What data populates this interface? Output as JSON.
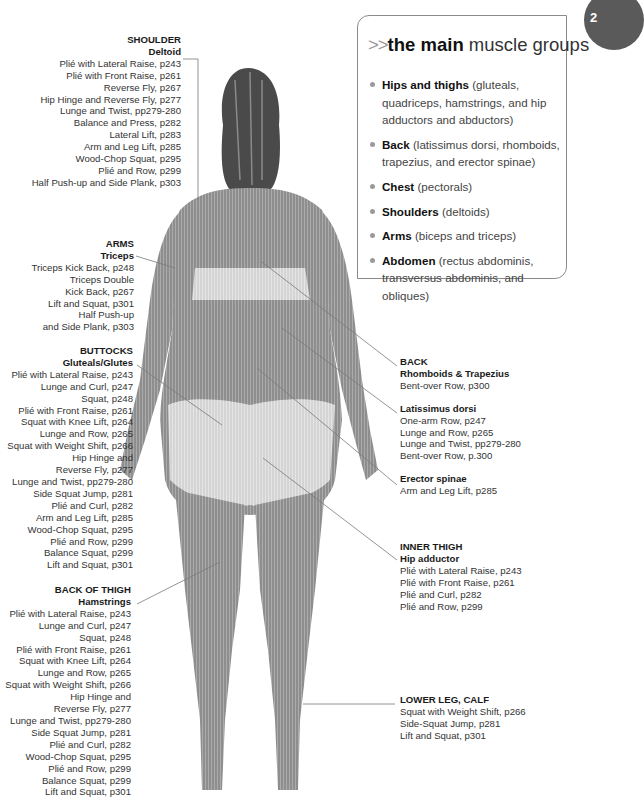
{
  "info_box": {
    "prefix": ">>",
    "title_bold": "the main",
    "title_rest": " muscle groups",
    "items": [
      {
        "name": "Hips and thighs",
        "detail": " (gluteals, quadriceps, hamstrings, and hip adductors and abductors)"
      },
      {
        "name": "Back",
        "detail": " (latissimus dorsi, rhomboids, trapezius, and erector spinae)"
      },
      {
        "name": "Chest",
        "detail": " (pectorals)"
      },
      {
        "name": "Shoulders",
        "detail": " (deltoids)"
      },
      {
        "name": "Arms",
        "detail": " (biceps and triceps)"
      },
      {
        "name": "Abdomen",
        "detail": " (rectus abdominis, transversus abdominis, and obliques)"
      }
    ]
  },
  "chapter_tab": {
    "label": "2"
  },
  "labels": {
    "shoulder": {
      "region": "SHOULDER",
      "muscle": "Deltoid",
      "exercises": [
        "Plié with Lateral Raise, p243",
        "Plié with Front Raise, p261",
        "Reverse Fly, p267",
        "Hip Hinge and Reverse Fly, p277",
        "Lunge and Twist, pp279-280",
        "Balance and Press, p282",
        "Lateral Lift, p283",
        "Arm and Leg Lift, p285",
        "Wood-Chop Squat, p295",
        "Plié and Row, p299",
        "Half Push-up and Side Plank, p303"
      ]
    },
    "arms": {
      "region": "ARMS",
      "muscle": "Triceps",
      "exercises": [
        "Triceps Kick Back, p248",
        "Triceps Double",
        "Kick Back, p267",
        "Lift and Squat, p301",
        "Half Push-up",
        "and Side Plank, p303"
      ]
    },
    "buttocks": {
      "region": "BUTTOCKS",
      "muscle": "Gluteals/Glutes",
      "exercises": [
        "Plié with Lateral Raise, p243",
        "Lunge and Curl, p247",
        "Squat, p248",
        "Plié with Front Raise, p261",
        "Squat with Knee Lift, p264",
        "Lunge and Row, p265",
        "Squat with Weight Shift, p266",
        "Hip Hinge and",
        "Reverse Fly, p277",
        "Lunge and Twist, pp279-280",
        "Side Squat Jump, p281",
        "Plié and Curl, p282",
        "Arm and Leg Lift, p285",
        "Wood-Chop Squat, p295",
        "Plié and Row, p299",
        "Balance Squat, p299",
        "Lift and Squat, p301"
      ]
    },
    "back_of_thigh": {
      "region": "BACK OF THIGH",
      "muscle": "Hamstrings",
      "exercises": [
        "Plié with Lateral Raise, p243",
        "Lunge and Curl, p247",
        "Squat, p248",
        "Plié with Front Raise, p261",
        "Squat with Knee Lift, p264",
        "Lunge and Row, p265",
        "Squat with Weight Shift, p266",
        "Hip Hinge and",
        "Reverse Fly, p277",
        "Lunge and Twist, pp279-280",
        "Side Squat Jump, p281",
        "Plié and Curl, p282",
        "Wood-Chop Squat, p295",
        "Plié and Row, p299",
        "Balance Squat, p299",
        "Lift and Squat, p301"
      ]
    },
    "back": {
      "region": "BACK",
      "rhomboids": {
        "muscle": "Rhomboids & Trapezius",
        "exercises": [
          "Bent-over Row, p300"
        ]
      },
      "latissimus": {
        "muscle": "Latissimus dorsi",
        "exercises": [
          "One-arm Row, p247",
          "Lunge and Row, p265",
          "Lunge and Twist, pp279-280",
          "Bent-over Row, p.300"
        ]
      },
      "erector": {
        "muscle": "Erector spinae",
        "exercises": [
          "Arm and Leg Lift, p285"
        ]
      }
    },
    "inner_thigh": {
      "region": "INNER THIGH",
      "muscle": "Hip adductor",
      "exercises": [
        "Plié with Lateral Raise, p243",
        "Plié with Front Raise, p261",
        "Plié and Curl, p282",
        "Plié and Row, p299"
      ]
    },
    "lower_leg": {
      "region": "LOWER LEG, CALF",
      "exercises": [
        "Squat with Weight Shift, p266",
        "Side-Squat Jump, p281",
        "Lift and Squat, p301"
      ]
    }
  }
}
